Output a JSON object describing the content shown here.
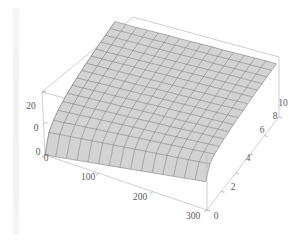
{
  "figure": {
    "title": "",
    "background_color": "#ffffff",
    "surface_color": "#d3d3d3",
    "mesh_color": "#6e6e6e",
    "box_color": "#b9b9b9",
    "label_color": "#5a5a5a"
  },
  "chart_data": {
    "type": "surface",
    "title": "",
    "xlabel": "",
    "ylabel": "",
    "zlabel": "",
    "xlim": [
      0,
      300
    ],
    "ylim": [
      0,
      10
    ],
    "zlim": [
      0,
      20
    ],
    "grid": true,
    "legend": "none",
    "projection": "3d",
    "mesh_rows": 15,
    "mesh_cols": 15,
    "x_ticks": [
      0,
      100,
      200,
      300
    ],
    "x_tick_labels": [
      "0",
      "100",
      "200",
      "300"
    ],
    "y_ticks": [
      0,
      2,
      4,
      6,
      8,
      10
    ],
    "y_tick_labels": [
      "0",
      "2",
      "4",
      "6",
      "8",
      "10"
    ],
    "z_ticks": [
      0,
      10,
      20
    ],
    "z_tick_labels": [
      "0",
      "0",
      "20"
    ],
    "x": [
      0,
      20,
      40,
      60,
      80,
      100,
      120,
      140,
      160,
      180,
      200,
      220,
      240,
      260,
      280,
      300
    ],
    "y": [
      0,
      0.6667,
      1.3333,
      2,
      2.6667,
      3.3333,
      4,
      4.6667,
      5.3333,
      6,
      6.6667,
      7.3333,
      8,
      8.6667,
      9.3333,
      10
    ],
    "z_description": "Near-planar surface rising steeply from z=0 near x=0 then flattening, with mild increase along y",
    "z": [
      [
        0.0,
        0.6,
        1.2,
        1.8,
        2.4,
        3.0,
        3.6,
        4.2,
        4.8,
        5.4,
        6.0,
        6.6,
        7.2,
        7.8,
        8.4,
        9.0
      ],
      [
        5.2,
        5.7,
        6.2,
        6.7,
        7.2,
        7.7,
        8.2,
        8.7,
        9.2,
        9.7,
        10.2,
        10.7,
        11.2,
        11.7,
        12.2,
        12.7
      ],
      [
        7.1,
        7.5,
        8.0,
        8.4,
        8.9,
        9.3,
        9.8,
        10.2,
        10.7,
        11.1,
        11.6,
        12.0,
        12.5,
        12.9,
        13.4,
        13.8
      ],
      [
        8.3,
        8.7,
        9.1,
        9.5,
        9.9,
        10.3,
        10.7,
        11.1,
        11.5,
        11.9,
        12.3,
        12.7,
        13.1,
        13.5,
        13.9,
        14.3
      ],
      [
        9.1,
        9.5,
        9.8,
        10.2,
        10.6,
        11.0,
        11.3,
        11.7,
        12.1,
        12.5,
        12.8,
        13.2,
        13.6,
        14.0,
        14.3,
        14.7
      ],
      [
        9.8,
        10.1,
        10.5,
        10.8,
        11.2,
        11.5,
        11.9,
        12.2,
        12.6,
        12.9,
        13.3,
        13.6,
        14.0,
        14.3,
        14.7,
        15.0
      ],
      [
        10.3,
        10.6,
        11.0,
        11.3,
        11.6,
        12.0,
        12.3,
        12.6,
        13.0,
        13.3,
        13.6,
        14.0,
        14.3,
        14.6,
        15.0,
        15.3
      ],
      [
        10.7,
        11.0,
        11.4,
        11.7,
        12.0,
        12.3,
        12.6,
        13.0,
        13.3,
        13.6,
        13.9,
        14.3,
        14.6,
        14.9,
        15.2,
        15.6
      ],
      [
        11.1,
        11.4,
        11.7,
        12.0,
        12.3,
        12.6,
        12.9,
        13.3,
        13.6,
        13.9,
        14.2,
        14.5,
        14.8,
        15.1,
        15.5,
        15.8
      ],
      [
        11.4,
        11.7,
        12.0,
        12.3,
        12.6,
        12.9,
        13.2,
        13.5,
        13.8,
        14.1,
        14.4,
        14.7,
        15.0,
        15.3,
        15.7,
        16.0
      ],
      [
        11.7,
        12.0,
        12.3,
        12.6,
        12.9,
        13.2,
        13.5,
        13.8,
        14.1,
        14.4,
        14.7,
        15.0,
        15.3,
        15.6,
        15.9,
        16.2
      ],
      [
        12.0,
        12.2,
        12.5,
        12.8,
        13.1,
        13.4,
        13.7,
        14.0,
        14.3,
        14.6,
        14.9,
        15.2,
        15.5,
        15.8,
        16.1,
        16.4
      ],
      [
        12.2,
        12.5,
        12.8,
        13.0,
        13.3,
        13.6,
        13.9,
        14.2,
        14.5,
        14.8,
        15.1,
        15.4,
        15.7,
        16.0,
        16.2,
        16.5
      ],
      [
        12.4,
        12.7,
        13.0,
        13.3,
        13.5,
        13.8,
        14.1,
        14.4,
        14.7,
        15.0,
        15.2,
        15.5,
        15.8,
        16.1,
        16.4,
        16.7
      ],
      [
        12.6,
        12.9,
        13.2,
        13.4,
        13.7,
        14.0,
        14.3,
        14.6,
        14.8,
        15.1,
        15.4,
        15.7,
        16.0,
        16.2,
        16.5,
        16.8
      ],
      [
        12.8,
        13.1,
        13.3,
        13.6,
        13.9,
        14.2,
        14.4,
        14.7,
        15.0,
        15.3,
        15.5,
        15.8,
        16.1,
        16.4,
        16.7,
        16.9
      ]
    ]
  },
  "axes": {
    "x_axis": {
      "name": "x-axis",
      "ticks": [
        {
          "label": "0",
          "x": 46,
          "y": 161
        },
        {
          "label": "100",
          "x": 88,
          "y": 180
        },
        {
          "label": "200",
          "x": 140,
          "y": 200
        },
        {
          "label": "300",
          "x": 193,
          "y": 219
        }
      ]
    },
    "y_axis": {
      "name": "y-axis",
      "ticks": [
        {
          "label": "0",
          "x": 216,
          "y": 219
        },
        {
          "label": "2",
          "x": 233,
          "y": 190
        },
        {
          "label": "4",
          "x": 248,
          "y": 161
        },
        {
          "label": "6",
          "x": 262,
          "y": 133
        },
        {
          "label": "8",
          "x": 275,
          "y": 119
        },
        {
          "label": "10",
          "x": 283,
          "y": 106
        }
      ]
    },
    "z_axis": {
      "name": "z-axis",
      "ticks": [
        {
          "label": "20",
          "x": 31,
          "y": 109
        },
        {
          "label": "0",
          "x": 36,
          "y": 131
        },
        {
          "label": "0",
          "x": 38,
          "y": 155
        }
      ]
    }
  }
}
